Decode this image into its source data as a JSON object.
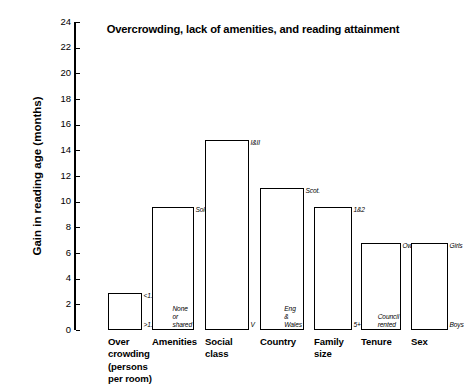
{
  "chart_data": {
    "type": "bar",
    "title": "Overcrowding, lack of amenities, and reading attainment",
    "xlabel": "",
    "ylabel": "Gain in reading age (months)",
    "ylim": [
      0,
      24
    ],
    "ytick_step": 2,
    "yticks": [
      "0",
      "2",
      "4",
      "6",
      "8",
      "10",
      "12",
      "14",
      "16",
      "18",
      "20",
      "22",
      "24"
    ],
    "grid": false,
    "legend": "none",
    "bar_style": "open outline, white fill, black border",
    "categories": [
      "Over\ncrowding\n(persons\nper room)",
      "Amenities",
      "Social\nclass",
      "Country",
      "Family\nsize",
      "Tenure",
      "Sex"
    ],
    "values": [
      2.9,
      9.6,
      14.8,
      11.1,
      9.6,
      6.8,
      6.75
    ],
    "bars": [
      {
        "category": "Over\ncrowding\n(persons\nper room)",
        "value": 2.9,
        "top_annotation": "<1.0",
        "bottom_annotation": ">1.5"
      },
      {
        "category": "Amenities",
        "value": 9.6,
        "top_annotation": "Sole",
        "bottom_annotation": "None\nor\nshared"
      },
      {
        "category": "Social\nclass",
        "value": 14.8,
        "top_annotation": "I&II",
        "bottom_annotation": "V"
      },
      {
        "category": "Country",
        "value": 11.1,
        "top_annotation": "Scot.",
        "bottom_annotation": "Eng\n&\nWales"
      },
      {
        "category": "Family\nsize",
        "value": 9.6,
        "top_annotation": "1&2",
        "bottom_annotation": "5+"
      },
      {
        "category": "Tenure",
        "value": 6.8,
        "top_annotation": "Owned",
        "bottom_annotation": "Council\nrented"
      },
      {
        "category": "Sex",
        "value": 6.75,
        "top_annotation": "Girls",
        "bottom_annotation": "Boys"
      }
    ],
    "colors": {
      "bar_fill": "#ffffff",
      "bar_stroke": "#000000",
      "axis": "#000000",
      "text": "#000000",
      "background": "#ffffff"
    }
  }
}
